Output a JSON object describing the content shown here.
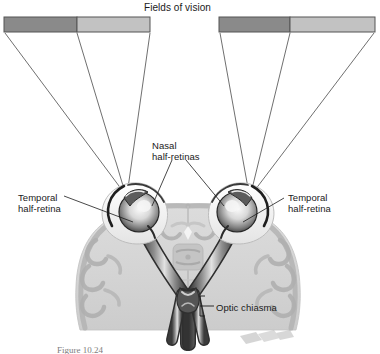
{
  "figure": {
    "title": "Fields of vision",
    "caption": "Figure 10.24",
    "labels": {
      "nasal": "Nasal\nhalf-retinas",
      "temporal_left": "Temporal\nhalf-retina",
      "temporal_right": "Temporal\nhalf-retina",
      "optic_chiasma": "Optic chiasma"
    },
    "colors": {
      "field_dark": "#8a8a8a",
      "field_light": "#c2c2c2",
      "outline": "#4a4a4a",
      "brain_fill": "#d9d9d9",
      "brain_mid": "#bcbcbc",
      "brain_dark": "#9b9b9b",
      "nerve_dark": "#3c3c3c",
      "nerve_light": "#cfcfcf",
      "eye_dark": "#2e2e2e",
      "eye_light": "#f2f2f2",
      "text": "#1a1a1a",
      "caption_text": "#7d7d7d"
    },
    "vision_fields": [
      {
        "name": "left-field-of-vision",
        "segments": [
          {
            "name": "left-field-dark-segment",
            "shade": "dark"
          },
          {
            "name": "left-field-light-segment",
            "shade": "light"
          }
        ]
      },
      {
        "name": "right-field-of-vision",
        "segments": [
          {
            "name": "right-field-dark-segment",
            "shade": "dark"
          },
          {
            "name": "right-field-light-segment",
            "shade": "light"
          }
        ]
      }
    ],
    "structures": [
      {
        "name": "left-eyeball"
      },
      {
        "name": "right-eyeball"
      },
      {
        "name": "left-optic-nerve"
      },
      {
        "name": "right-optic-nerve"
      },
      {
        "name": "optic-chiasma"
      },
      {
        "name": "left-optic-tract"
      },
      {
        "name": "right-optic-tract"
      },
      {
        "name": "brain-cross-section"
      }
    ]
  }
}
